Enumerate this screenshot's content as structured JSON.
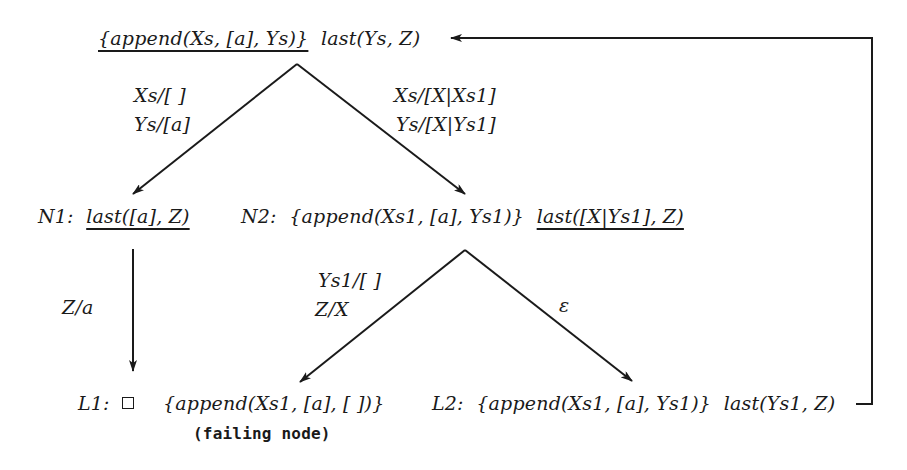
{
  "diagram": {
    "type": "SLD-derivation-tree",
    "root": {
      "prefix": "",
      "selected_goal": "{append(Xs, [a], Ys)}",
      "rest_goal": "last(Ys, Z)"
    },
    "nodes": {
      "n1": {
        "label": "N1:",
        "goal": "last([a], Z)"
      },
      "n2": {
        "label": "N2:",
        "goal_part1": "{append(Xs1, [a], Ys1)}",
        "goal_part2": "last([X|Ys1], Z)"
      },
      "l1": {
        "label": "L1:",
        "empty_clause": "□",
        "goal": "{append(Xs1, [a], [ ])}",
        "note": "(failing node)"
      },
      "l2": {
        "label": "L2:",
        "goal_part1": "{append(Xs1, [a], Ys1)}",
        "goal_part2": "last(Ys1, Z)"
      }
    },
    "edges": {
      "root_to_n1": {
        "sub1": "Xs/[ ]",
        "sub2": "Ys/[a]"
      },
      "root_to_n2": {
        "sub1": "Xs/[X|Xs1]",
        "sub2": "Ys/[X|Ys1]"
      },
      "n1_to_l1": {
        "sub1": "Z/a"
      },
      "n2_to_failing": {
        "sub1": "Ys1/[ ]",
        "sub2": "Z/X"
      },
      "n2_to_l2": {
        "sub1": "ε"
      },
      "l2_to_root": {
        "kind": "loop-back arrow"
      }
    },
    "colors": {
      "ink": "#1a1a1a",
      "background": "#ffffff"
    }
  }
}
